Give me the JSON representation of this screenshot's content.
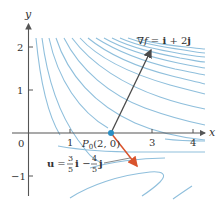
{
  "figure": {
    "axes": {
      "x_label": "x",
      "y_label": "y",
      "origin_label": "0",
      "x_ticks": [
        "1",
        "3",
        "4"
      ],
      "y_ticks": [
        "2",
        "1",
        "−1"
      ]
    },
    "point": {
      "label_P": "P",
      "label_sub": "0",
      "label_coords": "(2, 0)"
    },
    "gradient": {
      "label_nabla": "∇",
      "label_f": "f",
      "label_eq": " = ",
      "label_i": "i",
      "label_plus": " + 2",
      "label_j": "j"
    },
    "unit_vector": {
      "label_u": "u",
      "label_eq": " = ",
      "frac1_num": "3",
      "frac1_den": "5",
      "label_i": "i",
      "label_minus": " − ",
      "frac2_num": "4",
      "frac2_den": "5",
      "label_j": "j"
    },
    "colors": {
      "contour": "#8fbfdc",
      "axis": "#555555",
      "gradient_arrow": "#4a4a4a",
      "unit_arrow": "#d9532c",
      "point": "#2b8fc4"
    }
  }
}
